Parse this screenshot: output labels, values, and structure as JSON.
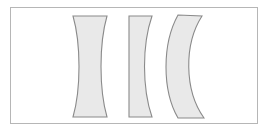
{
  "figure": {
    "title": "Concave lens cross-section shapes",
    "description": "Three shaded cross-sections of diverging lenses drawn inside a thin rectangular border.",
    "canvas": {
      "width": 268,
      "height": 131
    },
    "frame": {
      "x": 10,
      "y": 7,
      "width": 248,
      "height": 117,
      "border_color": "#b6b6b6",
      "background_color": "#ffffff"
    },
    "style": {
      "fill_color": "#e9e9e9",
      "stroke_color": "#8a8a8a",
      "stroke_width": 1.1
    },
    "shapes": [
      {
        "index": 1,
        "name": "biconcave-lens",
        "label": "Biconcave",
        "description": "Both optical surfaces curve inward, producing an hourglass profile that is thin at the centre and thick at the rim.",
        "top_edge": {
          "x_start": 73,
          "x_end": 107,
          "y": 16
        },
        "bottom_edge": {
          "x_start": 73,
          "x_end": 107,
          "y": 117
        },
        "waist": {
          "x_start": 84,
          "x_end": 96,
          "y": 66
        },
        "path": "M 73 16 L 107 16 C 99 44 99 89 107 117 L 73 117 C 81 89 81 44 73 16 Z"
      },
      {
        "index": 2,
        "name": "plano-concave-lens",
        "label": "Plano-concave",
        "description": "Flat left face with a concave right face; thickness decreases toward the middle.",
        "top_edge": {
          "x_start": 129,
          "x_end": 152,
          "y": 16
        },
        "bottom_edge": {
          "x_start": 129,
          "x_end": 152,
          "y": 117
        },
        "waist": {
          "x_start": 129,
          "x_end": 140,
          "y": 66
        },
        "path": "M 129 16 L 152 16 C 142 45 142 88 152 117 L 129 117 Z"
      },
      {
        "index": 3,
        "name": "convex-concave-meniscus-lens",
        "label": "Convex-concave meniscus",
        "description": "Both surfaces curve in the same direction, forming a crescent that is thinner at the centre than at the edges.",
        "top_edge": {
          "x_start": 178,
          "x_end": 202,
          "y": 15
        },
        "bottom_edge": {
          "x_start": 178,
          "x_end": 204,
          "y": 118
        },
        "waist": {
          "x_start": 170,
          "x_end": 182,
          "y": 66
        },
        "path": "M 178 15 L 202 16 C 184 44 184 90 204 118 L 178 118 C 162 90 162 44 178 15 Z"
      }
    ]
  }
}
